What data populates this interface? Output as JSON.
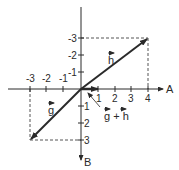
{
  "diagram": {
    "type": "vector-addition",
    "axes": {
      "x_label": "A",
      "y_label": "B",
      "x_ticks": [
        "-3",
        "-2",
        "-1",
        "1",
        "2",
        "3",
        "4"
      ],
      "y_ticks_up": [
        "-1",
        "-2",
        "-3"
      ],
      "y_ticks_down": [
        "1",
        "2",
        "3"
      ]
    },
    "vectors": [
      {
        "name": "h",
        "label": "h",
        "from": [
          0,
          0
        ],
        "to": [
          4,
          -3
        ]
      },
      {
        "name": "g",
        "label": "g",
        "from": [
          0,
          0
        ],
        "to": [
          -3,
          3
        ]
      },
      {
        "name": "g_plus_h",
        "label": "g + h",
        "from": [
          0,
          0
        ],
        "to": [
          1,
          0
        ]
      }
    ],
    "colors": {
      "ink": "#2a2a2a",
      "background": "#ffffff"
    }
  }
}
